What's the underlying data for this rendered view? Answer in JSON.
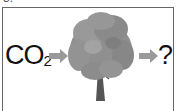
{
  "question_number": "3.",
  "diagram": {
    "input": {
      "formula": "CO",
      "subscript": "2"
    },
    "middle_icon": "tree-icon",
    "output": "?",
    "arrow_color": "#9a9a9a",
    "tree_color": "#8a8a8a",
    "trunk_color": "#555555"
  }
}
